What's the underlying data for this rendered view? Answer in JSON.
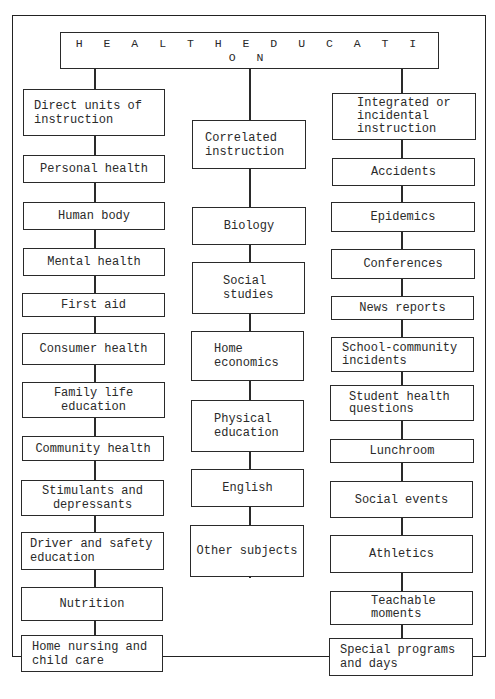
{
  "title": "H E A L T H     E D U C A T I O N",
  "columns": [
    {
      "heading": "Direct units of\ninstruction",
      "items": [
        "Personal health",
        "Human body",
        "Mental health",
        "First aid",
        "Consumer health",
        "Family life\neducation",
        "Community health",
        "Stimulants and\ndepressants",
        "Driver and safety\neducation",
        "Nutrition",
        "Home nursing and\nchild care"
      ]
    },
    {
      "heading": "Correlated\ninstruction",
      "items": [
        "Biology",
        "Social\nstudies",
        "Home\neconomics",
        "Physical\neducation",
        "English",
        "Other subjects"
      ]
    },
    {
      "heading": "Integrated or\nincidental\ninstruction",
      "items": [
        "Accidents",
        "Epidemics",
        "Conferences",
        "News reports",
        "School-community\nincidents",
        "Student health\nquestions",
        "Lunchroom",
        "Social events",
        "Athletics",
        "Teachable\nmoments",
        "Special programs\nand days"
      ]
    }
  ]
}
